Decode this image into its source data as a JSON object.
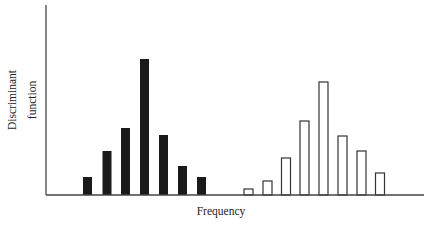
{
  "chart_data": {
    "type": "bar",
    "title": "",
    "xlabel": "Frequency",
    "ylabel": [
      "Discriminant",
      "function"
    ],
    "ylim": [
      0,
      190
    ],
    "grid": false,
    "legend": null,
    "series": [
      {
        "name": "Group A (filled)",
        "style": "filled",
        "color": "#1a1a1a",
        "x": [
          87.5,
          107,
          125.5,
          144.5,
          163.5,
          182.5,
          201.5
        ],
        "values": [
          18,
          44,
          67,
          136,
          60,
          29,
          18
        ]
      },
      {
        "name": "Group B (outline)",
        "style": "outline",
        "color": "#333333",
        "x": [
          248.5,
          267.5,
          286,
          304.5,
          323.5,
          342.5,
          361.5,
          380
        ],
        "values": [
          6,
          14,
          37,
          74,
          113,
          59,
          44,
          22
        ]
      }
    ]
  },
  "layout": {
    "origin_x": 46,
    "baseline_y": 195,
    "axis_top_y": 5,
    "axis_right_x": 424,
    "bar_width": 9,
    "plot_height_px": 190
  },
  "labels": {
    "x": "Frequency",
    "y_line1": "Discriminant",
    "y_line2": "function"
  }
}
